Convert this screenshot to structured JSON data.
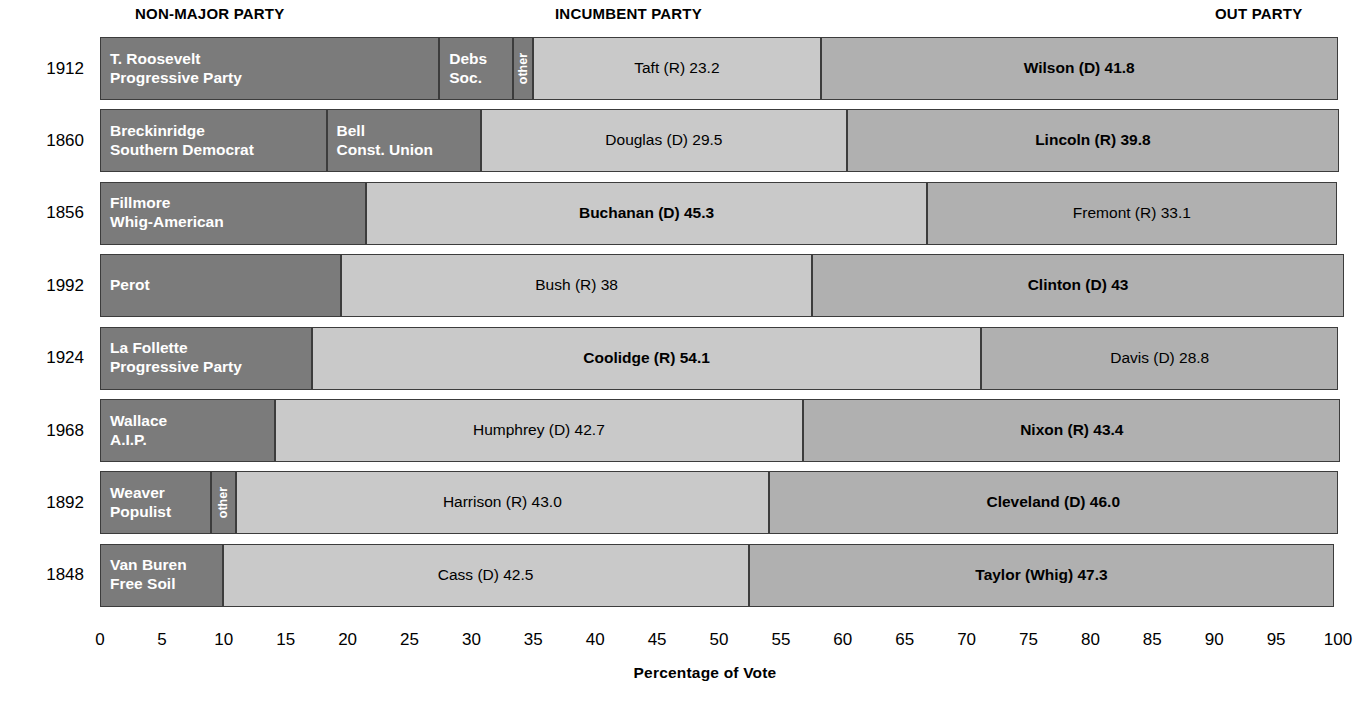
{
  "headers": [
    {
      "label": "NON-MAJOR PARTY"
    },
    {
      "label": "INCUMBENT PARTY"
    },
    {
      "label": "OUT PARTY"
    }
  ],
  "axis": {
    "title": "Percentage of Vote",
    "ticks": [
      "0",
      "5",
      "10",
      "15",
      "20",
      "25",
      "30",
      "35",
      "40",
      "45",
      "50",
      "55",
      "60",
      "65",
      "70",
      "75",
      "80",
      "85",
      "90",
      "95",
      "100"
    ],
    "min": 0,
    "max": 100,
    "step": 5
  },
  "colors": {
    "nonmajor": "#7b7b7b",
    "incumbent": "#c9c9c9",
    "outparty": "#b0b0b0",
    "border": "#3c3c3c",
    "background": "#ffffff"
  },
  "chart_data": {
    "type": "bar",
    "orientation": "horizontal",
    "stacked": true,
    "title": "",
    "xlabel": "Percentage of Vote",
    "ylabel": "",
    "xlim": [
      0,
      100
    ],
    "grid": false,
    "legend": [
      "NON-MAJOR PARTY",
      "INCUMBENT PARTY",
      "OUT PARTY"
    ],
    "categories": [
      "1912",
      "1860",
      "1856",
      "1992",
      "1924",
      "1968",
      "1892",
      "1848"
    ],
    "rows": [
      {
        "year": "1912",
        "segments": [
          {
            "label": "T. Roosevelt\nProgressive Party",
            "value": 27.4,
            "type": "nonmajor",
            "bold": true
          },
          {
            "label": "Debs\nSoc.",
            "value": 6.0,
            "type": "nonmajor",
            "bold": true
          },
          {
            "label": "other",
            "value": 1.6,
            "type": "nonmajor",
            "vertical": true,
            "bold": true
          },
          {
            "label": "Taft (R) 23.2",
            "value": 23.2,
            "type": "incumbent",
            "bold": false
          },
          {
            "label": "Wilson (D) 41.8",
            "value": 41.8,
            "type": "outparty",
            "bold": true
          }
        ]
      },
      {
        "year": "1860",
        "segments": [
          {
            "label": "Breckinridge\nSouthern Democrat",
            "value": 18.3,
            "type": "nonmajor",
            "bold": true
          },
          {
            "label": "Bell\nConst. Union",
            "value": 12.5,
            "type": "nonmajor",
            "bold": true
          },
          {
            "label": "Douglas (D) 29.5",
            "value": 29.5,
            "type": "incumbent",
            "bold": false
          },
          {
            "label": "Lincoln (R) 39.8",
            "value": 39.8,
            "type": "outparty",
            "bold": true
          }
        ]
      },
      {
        "year": "1856",
        "segments": [
          {
            "label": "Fillmore\nWhig-American",
            "value": 21.5,
            "type": "nonmajor",
            "bold": true
          },
          {
            "label": "Buchanan (D) 45.3",
            "value": 45.3,
            "type": "incumbent",
            "bold": true
          },
          {
            "label": "Fremont (R) 33.1",
            "value": 33.1,
            "type": "outparty",
            "bold": false
          }
        ]
      },
      {
        "year": "1992",
        "segments": [
          {
            "label": "Perot",
            "value": 19.5,
            "type": "nonmajor",
            "bold": true
          },
          {
            "label": "Bush (R) 38",
            "value": 38.0,
            "type": "incumbent",
            "bold": false
          },
          {
            "label": "Clinton (D) 43",
            "value": 43.0,
            "type": "outparty",
            "bold": true
          }
        ]
      },
      {
        "year": "1924",
        "segments": [
          {
            "label": "La Follette\nProgressive Party",
            "value": 17.1,
            "type": "nonmajor",
            "bold": true
          },
          {
            "label": "Coolidge (R) 54.1",
            "value": 54.1,
            "type": "incumbent",
            "bold": true
          },
          {
            "label": "Davis (D) 28.8",
            "value": 28.8,
            "type": "outparty",
            "bold": false
          }
        ]
      },
      {
        "year": "1968",
        "segments": [
          {
            "label": "Wallace\nA.I.P.",
            "value": 14.1,
            "type": "nonmajor",
            "bold": true
          },
          {
            "label": "Humphrey (D) 42.7",
            "value": 42.7,
            "type": "incumbent",
            "bold": false
          },
          {
            "label": "Nixon (R) 43.4",
            "value": 43.4,
            "type": "outparty",
            "bold": true
          }
        ]
      },
      {
        "year": "1892",
        "segments": [
          {
            "label": "Weaver\nPopulist",
            "value": 9.0,
            "type": "nonmajor",
            "bold": true
          },
          {
            "label": "other",
            "value": 2.0,
            "type": "nonmajor",
            "vertical": true,
            "bold": true
          },
          {
            "label": "Harrison (R) 43.0",
            "value": 43.0,
            "type": "incumbent",
            "bold": false
          },
          {
            "label": "Cleveland (D) 46.0",
            "value": 46.0,
            "type": "outparty",
            "bold": true
          }
        ]
      },
      {
        "year": "1848",
        "segments": [
          {
            "label": "Van Buren\nFree Soil",
            "value": 9.9,
            "type": "nonmajor",
            "bold": true
          },
          {
            "label": "Cass (D) 42.5",
            "value": 42.5,
            "type": "incumbent",
            "bold": false
          },
          {
            "label": "Taylor (Whig) 47.3",
            "value": 47.3,
            "type": "outparty",
            "bold": true
          }
        ]
      }
    ]
  }
}
